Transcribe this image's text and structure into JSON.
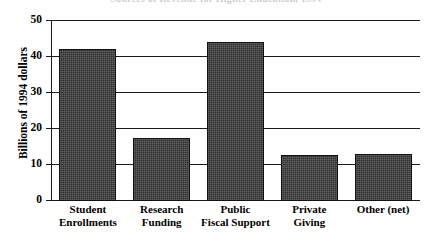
{
  "chart_data": {
    "type": "bar",
    "title": "Sources of Revenue for Higher Education, 1994",
    "xlabel": "",
    "ylabel": "Billions of 1994 dollars",
    "ylim": [
      0,
      50
    ],
    "yticks": [
      0,
      10,
      20,
      30,
      40,
      50
    ],
    "ytick_labels": [
      "0",
      "10",
      "20",
      "30",
      "40",
      "50"
    ],
    "grid": true,
    "legend": false,
    "legend_position": "none",
    "categories": [
      "Student Enrollments",
      "Research Funding",
      "Public Fiscal Support",
      "Private Giving",
      "Other (net)"
    ],
    "category_lines": [
      [
        "Student",
        "Enrollments"
      ],
      [
        "Research",
        "Funding"
      ],
      [
        "Public",
        "Fiscal Support"
      ],
      [
        "Private",
        "Giving"
      ],
      [
        "Other (net)",
        ""
      ]
    ],
    "values": [
      42,
      17.3,
      44,
      12.4,
      12.8
    ],
    "bar_color": "#3c3c3c",
    "bar_edge_color": "#111111",
    "axis_color": "#1a1a1a",
    "background_color": "#ffffff"
  }
}
